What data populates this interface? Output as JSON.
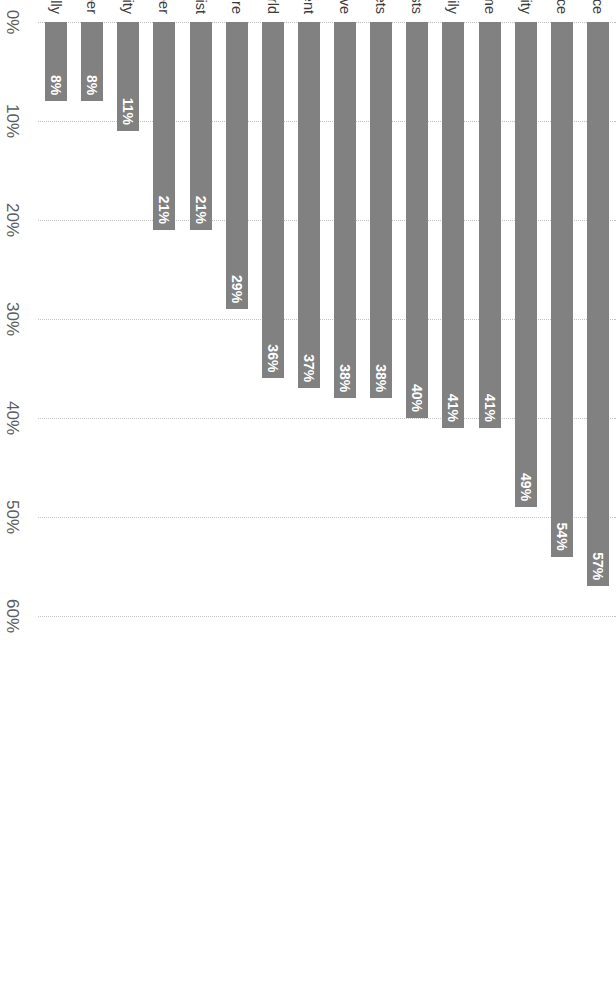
{
  "chart_data": {
    "type": "bar",
    "orientation": "horizontal",
    "title": "",
    "subtitle": "",
    "xlabel": "",
    "ylabel": "",
    "xlim": [
      0,
      60
    ],
    "grid": true,
    "legend": false,
    "value_suffix": "%",
    "bar_color": "#818181",
    "value_label_color": "#ffffff",
    "gridline_color": "#c3c3c3",
    "axis_label_color": "#5d5d5d",
    "category_label_color": "#3d3d3d",
    "tick_labels": [
      "0%",
      "10%",
      "20%",
      "30%",
      "40%",
      "50%",
      "60%"
    ],
    "tick_values": [
      0,
      10,
      20,
      30,
      40,
      50,
      60
    ],
    "categories": [
      "Having the lifestyle of my choice",
      "Having financial freedom and independence",
      "Having safety and security",
      "Owning a home",
      "Having a family",
      "Pursuing hobbies and interests",
      "Having no regrets",
      "Freeing up time with those I love",
      "Setting myself financially for retirement",
      "Traveling the world",
      "Having a plan for the future",
      "Completing my bucket list",
      "Excelling in my current career",
      "Having an impact on my local community",
      "Pursuing a new career",
      "Having an impact globally"
    ],
    "values": [
      57,
      54,
      49,
      41,
      41,
      40,
      38,
      38,
      37,
      36,
      29,
      21,
      21,
      11,
      8,
      8
    ],
    "data_labels": [
      "57%",
      "54%",
      "49%",
      "41%",
      "41%",
      "40%",
      "38%",
      "38%",
      "37%",
      "36%",
      "29%",
      "21%",
      "21%",
      "11%",
      "8%",
      "8%"
    ]
  }
}
